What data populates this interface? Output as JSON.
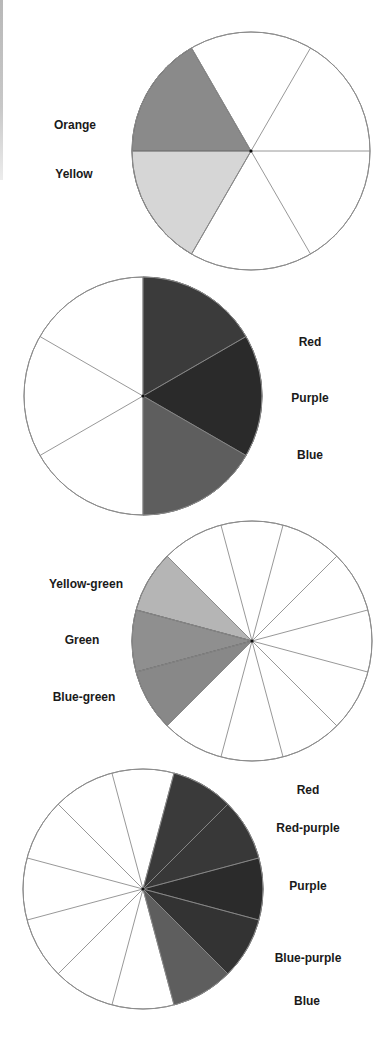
{
  "figure": {
    "stroke_color": "#8c8c8c",
    "divider_color": "#555555"
  },
  "wheels": [
    {
      "id": "wheel-1",
      "center": [
        251,
        151
      ],
      "radius": 119,
      "segments": 6,
      "start_angle_deg": 0,
      "highlighted": [
        {
          "label": "Orange",
          "from_deg": 120,
          "to_deg": 180,
          "color": "#8a8a8a"
        },
        {
          "label": "Yellow",
          "from_deg": 180,
          "to_deg": 240,
          "color": "#d6d6d6"
        }
      ],
      "labels": [
        {
          "text": "Orange",
          "x": 75,
          "y": 125
        },
        {
          "text": "Yellow",
          "x": 74,
          "y": 174
        }
      ]
    },
    {
      "id": "wheel-2",
      "center": [
        143,
        396
      ],
      "radius": 119,
      "segments": 6,
      "start_angle_deg": 30,
      "highlighted": [
        {
          "label": "Red",
          "from_deg": 30,
          "to_deg": 90,
          "color": "#3b3b3b"
        },
        {
          "label": "Purple",
          "from_deg": -30,
          "to_deg": 30,
          "color": "#2a2a2a"
        },
        {
          "label": "Blue",
          "from_deg": -90,
          "to_deg": -30,
          "color": "#5e5e5e"
        }
      ],
      "labels": [
        {
          "text": "Red",
          "x": 310,
          "y": 342
        },
        {
          "text": "Purple",
          "x": 310,
          "y": 398
        },
        {
          "text": "Blue",
          "x": 310,
          "y": 455
        }
      ]
    },
    {
      "id": "wheel-3",
      "center": [
        252,
        641
      ],
      "radius": 120,
      "segments": 12,
      "start_angle_deg": 15,
      "highlighted": [
        {
          "label": "Yellow-green",
          "from_deg": 135,
          "to_deg": 165,
          "color": "#b5b5b5"
        },
        {
          "label": "Green",
          "from_deg": 165,
          "to_deg": 195,
          "color": "#8f8f8f"
        },
        {
          "label": "Blue-green",
          "from_deg": 195,
          "to_deg": 225,
          "color": "#888888"
        }
      ],
      "labels": [
        {
          "text": "Yellow-green",
          "x": 86,
          "y": 584
        },
        {
          "text": "Green",
          "x": 82,
          "y": 640
        },
        {
          "text": "Blue-green",
          "x": 84,
          "y": 697
        }
      ]
    },
    {
      "id": "wheel-4",
      "center": [
        143,
        889
      ],
      "radius": 120,
      "segments": 12,
      "start_angle_deg": 15,
      "highlighted": [
        {
          "label": "Red",
          "from_deg": 45,
          "to_deg": 75,
          "color": "#3a3a3a"
        },
        {
          "label": "Red-purple",
          "from_deg": 15,
          "to_deg": 45,
          "color": "#383838"
        },
        {
          "label": "Purple",
          "from_deg": -15,
          "to_deg": 15,
          "color": "#2b2b2b"
        },
        {
          "label": "Blue-purple",
          "from_deg": -45,
          "to_deg": -15,
          "color": "#333333"
        },
        {
          "label": "Blue",
          "from_deg": -75,
          "to_deg": -45,
          "color": "#5e5e5e"
        }
      ],
      "labels": [
        {
          "text": "Red",
          "x": 308,
          "y": 790
        },
        {
          "text": "Red-purple",
          "x": 308,
          "y": 828
        },
        {
          "text": "Purple",
          "x": 308,
          "y": 886
        },
        {
          "text": "Blue-purple",
          "x": 308,
          "y": 958
        },
        {
          "text": "Blue",
          "x": 307,
          "y": 1001
        }
      ]
    }
  ]
}
